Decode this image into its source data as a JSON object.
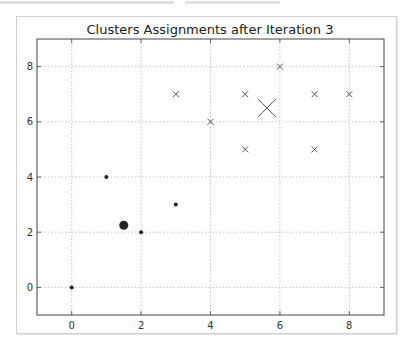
{
  "page": {
    "top_strip_note": "cropped, illegible text"
  },
  "chart_data": {
    "type": "scatter",
    "title": "Clusters Assignments after Iteration 3",
    "xlabel": "",
    "ylabel": "",
    "xlim": [
      -1,
      9
    ],
    "ylim": [
      -1,
      9
    ],
    "xticks": [
      0,
      2,
      4,
      6,
      8
    ],
    "yticks": [
      0,
      2,
      4,
      6,
      8
    ],
    "grid": true,
    "legend": null,
    "series": [
      {
        "name": "cluster-1",
        "marker": "dot",
        "points": [
          [
            0,
            0
          ],
          [
            1,
            4
          ],
          [
            2,
            2
          ],
          [
            3,
            3
          ]
        ],
        "centroid": [
          1.5,
          2.25
        ],
        "centroid_marker": "large-dot"
      },
      {
        "name": "cluster-2",
        "marker": "x",
        "points": [
          [
            3,
            7
          ],
          [
            4,
            6
          ],
          [
            5,
            7
          ],
          [
            5,
            5
          ],
          [
            6,
            8
          ],
          [
            7,
            7
          ],
          [
            7,
            5
          ],
          [
            8,
            7
          ]
        ],
        "centroid": [
          5.625,
          6.5
        ],
        "centroid_marker": "large-x"
      }
    ],
    "colors": {
      "dot": "#222222",
      "x": "#555555",
      "grid": "#b8b8b8",
      "axes": "#444444"
    }
  }
}
